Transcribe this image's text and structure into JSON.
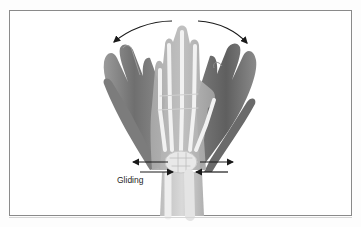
{
  "figure": {
    "type": "anatomical-illustration",
    "labels": {
      "gliding": "Gliding"
    },
    "arrows": {
      "top_curved": [
        "left",
        "right"
      ],
      "wrist_straight": [
        "upper-left-outward",
        "lower-left-inward",
        "upper-right-outward",
        "lower-right-inward"
      ]
    },
    "colors": {
      "frame": "#8a8a8a",
      "arrow": "#1a1a1a",
      "skin_dark": "#6e6e6e",
      "skin_light": "#b5b5b5",
      "bone": "#e6e6e6"
    }
  }
}
